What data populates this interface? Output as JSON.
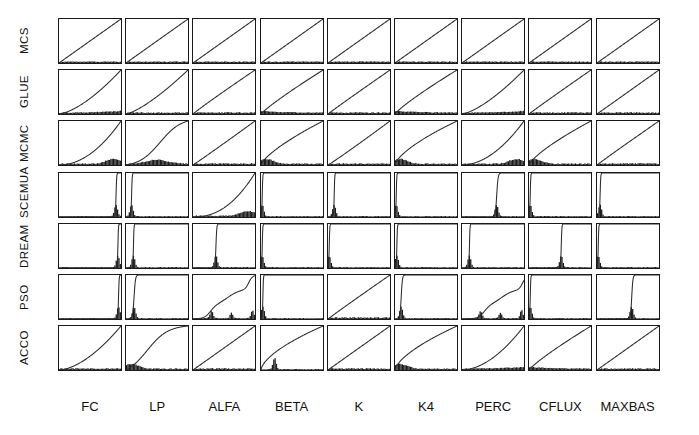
{
  "figure": {
    "type": "small-multiples-grid",
    "rows": 7,
    "cols": 9,
    "panel_type": "cdf-with-histogram"
  },
  "row_labels": [
    "MCS",
    "GLUE",
    "MCMC",
    "SCEMUA",
    "DREAM",
    "PSO",
    "ACCO"
  ],
  "col_labels": [
    "FC",
    "LP",
    "ALFA",
    "BETA",
    "K",
    "K4",
    "PERC",
    "CFLUX",
    "MAXBAS"
  ],
  "colors": {
    "curve": "#2b2b2b",
    "histogram": "#1b1b1b",
    "frame": "#1a1a1a",
    "background": "#ffffff"
  },
  "chart_data": {
    "type": "line",
    "title": "",
    "xlabel": "",
    "ylabel": "",
    "xlim": [
      0,
      1
    ],
    "ylim": [
      0,
      1
    ],
    "grid": false,
    "legend": "none",
    "x_categories": [
      "FC",
      "LP",
      "ALFA",
      "BETA",
      "K",
      "K4",
      "PERC",
      "CFLUX",
      "MAXBAS"
    ],
    "y_categories": [
      "MCS",
      "GLUE",
      "MCMC",
      "SCEMUA",
      "DREAM",
      "PSO",
      "ACCO"
    ],
    "panels": [
      {
        "row": "MCS",
        "col": "FC",
        "cdf_shape": "linear",
        "knee": 0.5,
        "sharp": 0.0,
        "hist": "uniform"
      },
      {
        "row": "MCS",
        "col": "LP",
        "cdf_shape": "linear",
        "knee": 0.5,
        "sharp": 0.0,
        "hist": "uniform"
      },
      {
        "row": "MCS",
        "col": "ALFA",
        "cdf_shape": "linear",
        "knee": 0.5,
        "sharp": 0.0,
        "hist": "uniform"
      },
      {
        "row": "MCS",
        "col": "BETA",
        "cdf_shape": "linear",
        "knee": 0.5,
        "sharp": 0.0,
        "hist": "uniform"
      },
      {
        "row": "MCS",
        "col": "K",
        "cdf_shape": "linear",
        "knee": 0.5,
        "sharp": 0.0,
        "hist": "uniform"
      },
      {
        "row": "MCS",
        "col": "K4",
        "cdf_shape": "linear",
        "knee": 0.5,
        "sharp": 0.0,
        "hist": "uniform"
      },
      {
        "row": "MCS",
        "col": "PERC",
        "cdf_shape": "linear",
        "knee": 0.5,
        "sharp": 0.0,
        "hist": "uniform"
      },
      {
        "row": "MCS",
        "col": "CFLUX",
        "cdf_shape": "linear",
        "knee": 0.5,
        "sharp": 0.0,
        "hist": "uniform"
      },
      {
        "row": "MCS",
        "col": "MAXBAS",
        "cdf_shape": "linear",
        "knee": 0.5,
        "sharp": 0.0,
        "hist": "uniform"
      },
      {
        "row": "GLUE",
        "col": "FC",
        "cdf_shape": "convex",
        "knee": 0.62,
        "sharp": 0.0,
        "hist": "low-right"
      },
      {
        "row": "GLUE",
        "col": "LP",
        "cdf_shape": "convex",
        "knee": 0.58,
        "sharp": 0.0,
        "hist": "low-flat"
      },
      {
        "row": "GLUE",
        "col": "ALFA",
        "cdf_shape": "near-linear",
        "knee": 0.54,
        "sharp": 0.0,
        "hist": "low-flat"
      },
      {
        "row": "GLUE",
        "col": "BETA",
        "cdf_shape": "concave",
        "knee": 0.42,
        "sharp": 0.0,
        "hist": "low-left"
      },
      {
        "row": "GLUE",
        "col": "K",
        "cdf_shape": "near-linear",
        "knee": 0.52,
        "sharp": 0.0,
        "hist": "low-flat"
      },
      {
        "row": "GLUE",
        "col": "K4",
        "cdf_shape": "concave",
        "knee": 0.4,
        "sharp": 0.0,
        "hist": "low-left"
      },
      {
        "row": "GLUE",
        "col": "PERC",
        "cdf_shape": "convex",
        "knee": 0.6,
        "sharp": 0.0,
        "hist": "low-right"
      },
      {
        "row": "GLUE",
        "col": "CFLUX",
        "cdf_shape": "near-linear",
        "knee": 0.52,
        "sharp": 0.0,
        "hist": "low-flat"
      },
      {
        "row": "GLUE",
        "col": "MAXBAS",
        "cdf_shape": "near-linear",
        "knee": 0.5,
        "sharp": 0.0,
        "hist": "low-flat"
      },
      {
        "row": "MCMC",
        "col": "FC",
        "cdf_shape": "convex",
        "knee": 0.74,
        "sharp": 0.0,
        "hist": "bump-right"
      },
      {
        "row": "MCMC",
        "col": "LP",
        "cdf_shape": "sigmoid",
        "knee": 0.55,
        "sharp": 0.0,
        "hist": "bump-center"
      },
      {
        "row": "MCMC",
        "col": "ALFA",
        "cdf_shape": "near-linear",
        "knee": 0.48,
        "sharp": 0.0,
        "hist": "low-flat"
      },
      {
        "row": "MCMC",
        "col": "BETA",
        "cdf_shape": "concave",
        "knee": 0.3,
        "sharp": 0.0,
        "hist": "bump-left"
      },
      {
        "row": "MCMC",
        "col": "K",
        "cdf_shape": "near-linear",
        "knee": 0.46,
        "sharp": 0.0,
        "hist": "low-flat"
      },
      {
        "row": "MCMC",
        "col": "K4",
        "cdf_shape": "concave",
        "knee": 0.26,
        "sharp": 0.0,
        "hist": "bump-left"
      },
      {
        "row": "MCMC",
        "col": "PERC",
        "cdf_shape": "convex",
        "knee": 0.72,
        "sharp": 0.0,
        "hist": "bump-right"
      },
      {
        "row": "MCMC",
        "col": "CFLUX",
        "cdf_shape": "concave",
        "knee": 0.32,
        "sharp": 0.0,
        "hist": "bump-left"
      },
      {
        "row": "MCMC",
        "col": "MAXBAS",
        "cdf_shape": "near-linear",
        "knee": 0.52,
        "sharp": 0.0,
        "hist": "low-flat"
      },
      {
        "row": "SCEMUA",
        "col": "FC",
        "cdf_shape": "step",
        "knee": 0.92,
        "sharp": 0.97,
        "hist": "spike-right"
      },
      {
        "row": "SCEMUA",
        "col": "LP",
        "cdf_shape": "step",
        "knee": 0.09,
        "sharp": 0.97,
        "hist": "spike-left"
      },
      {
        "row": "SCEMUA",
        "col": "ALFA",
        "cdf_shape": "convex",
        "knee": 0.8,
        "sharp": 0.0,
        "hist": "bump-right"
      },
      {
        "row": "SCEMUA",
        "col": "BETA",
        "cdf_shape": "step",
        "knee": 0.02,
        "sharp": 0.99,
        "hist": "spike-left"
      },
      {
        "row": "SCEMUA",
        "col": "K",
        "cdf_shape": "step",
        "knee": 0.1,
        "sharp": 0.98,
        "hist": "spike-left"
      },
      {
        "row": "SCEMUA",
        "col": "K4",
        "cdf_shape": "step",
        "knee": 0.02,
        "sharp": 0.99,
        "hist": "spike-left"
      },
      {
        "row": "SCEMUA",
        "col": "PERC",
        "cdf_shape": "step",
        "knee": 0.56,
        "sharp": 0.93,
        "hist": "spike-center"
      },
      {
        "row": "SCEMUA",
        "col": "CFLUX",
        "cdf_shape": "step",
        "knee": 0.02,
        "sharp": 0.99,
        "hist": "spike-left"
      },
      {
        "row": "SCEMUA",
        "col": "MAXBAS",
        "cdf_shape": "step",
        "knee": 0.05,
        "sharp": 0.97,
        "hist": "spike-left"
      },
      {
        "row": "DREAM",
        "col": "FC",
        "cdf_shape": "step",
        "knee": 0.95,
        "sharp": 0.98,
        "hist": "spike-right"
      },
      {
        "row": "DREAM",
        "col": "LP",
        "cdf_shape": "step",
        "knee": 0.12,
        "sharp": 0.99,
        "hist": "spike-left"
      },
      {
        "row": "DREAM",
        "col": "ALFA",
        "cdf_shape": "step",
        "knee": 0.37,
        "sharp": 0.96,
        "hist": "spike-center"
      },
      {
        "row": "DREAM",
        "col": "BETA",
        "cdf_shape": "step",
        "knee": 0.02,
        "sharp": 0.99,
        "hist": "spike-left"
      },
      {
        "row": "DREAM",
        "col": "K",
        "cdf_shape": "step",
        "knee": 0.02,
        "sharp": 0.99,
        "hist": "spike-left"
      },
      {
        "row": "DREAM",
        "col": "K4",
        "cdf_shape": "step",
        "knee": 0.03,
        "sharp": 0.98,
        "hist": "spike-left"
      },
      {
        "row": "DREAM",
        "col": "PERC",
        "cdf_shape": "step",
        "knee": 0.12,
        "sharp": 0.98,
        "hist": "spike-left"
      },
      {
        "row": "DREAM",
        "col": "CFLUX",
        "cdf_shape": "step",
        "knee": 0.52,
        "sharp": 0.97,
        "hist": "spike-center"
      },
      {
        "row": "DREAM",
        "col": "MAXBAS",
        "cdf_shape": "step",
        "knee": 0.02,
        "sharp": 0.99,
        "hist": "spike-left"
      },
      {
        "row": "PSO",
        "col": "FC",
        "cdf_shape": "step",
        "knee": 0.96,
        "sharp": 0.97,
        "hist": "spike-right"
      },
      {
        "row": "PSO",
        "col": "LP",
        "cdf_shape": "step",
        "knee": 0.13,
        "sharp": 0.93,
        "hist": "spike-left"
      },
      {
        "row": "PSO",
        "col": "ALFA",
        "cdf_shape": "staircase",
        "knee": 0.62,
        "sharp": 0.4,
        "hist": "multi-spike"
      },
      {
        "row": "PSO",
        "col": "BETA",
        "cdf_shape": "step",
        "knee": 0.03,
        "sharp": 0.98,
        "hist": "spike-left"
      },
      {
        "row": "PSO",
        "col": "K",
        "cdf_shape": "near-linear",
        "knee": 0.52,
        "sharp": 0.0,
        "hist": "low-flat"
      },
      {
        "row": "PSO",
        "col": "K4",
        "cdf_shape": "step",
        "knee": 0.1,
        "sharp": 0.94,
        "hist": "spike-left"
      },
      {
        "row": "PSO",
        "col": "PERC",
        "cdf_shape": "staircase",
        "knee": 0.7,
        "sharp": 0.45,
        "hist": "multi-spike"
      },
      {
        "row": "PSO",
        "col": "CFLUX",
        "cdf_shape": "step",
        "knee": 0.02,
        "sharp": 0.99,
        "hist": "spike-left"
      },
      {
        "row": "PSO",
        "col": "MAXBAS",
        "cdf_shape": "step",
        "knee": 0.56,
        "sharp": 0.94,
        "hist": "spike-center"
      },
      {
        "row": "ACCO",
        "col": "FC",
        "cdf_shape": "convex",
        "knee": 0.66,
        "sharp": 0.0,
        "hist": "low-flat"
      },
      {
        "row": "ACCO",
        "col": "LP",
        "cdf_shape": "sigmoid",
        "knee": 0.34,
        "sharp": 0.0,
        "hist": "bump-left"
      },
      {
        "row": "ACCO",
        "col": "ALFA",
        "cdf_shape": "near-linear",
        "knee": 0.5,
        "sharp": 0.0,
        "hist": "low-flat"
      },
      {
        "row": "ACCO",
        "col": "BETA",
        "cdf_shape": "concave",
        "knee": 0.22,
        "sharp": 0.0,
        "hist": "spike-left"
      },
      {
        "row": "ACCO",
        "col": "K",
        "cdf_shape": "near-linear",
        "knee": 0.5,
        "sharp": 0.0,
        "hist": "low-flat"
      },
      {
        "row": "ACCO",
        "col": "K4",
        "cdf_shape": "concave",
        "knee": 0.24,
        "sharp": 0.0,
        "hist": "bump-left"
      },
      {
        "row": "ACCO",
        "col": "PERC",
        "cdf_shape": "convex",
        "knee": 0.7,
        "sharp": 0.0,
        "hist": "low-right"
      },
      {
        "row": "ACCO",
        "col": "CFLUX",
        "cdf_shape": "concave",
        "knee": 0.4,
        "sharp": 0.0,
        "hist": "low-left"
      },
      {
        "row": "ACCO",
        "col": "MAXBAS",
        "cdf_shape": "linear",
        "knee": 0.52,
        "sharp": 0.0,
        "hist": "low-flat"
      }
    ]
  },
  "layout": {
    "grid_left": 58,
    "grid_top": 18,
    "panel_w": 64,
    "panel_h": 46,
    "gap_x": 3.2,
    "gap_y": 5.2,
    "col_label_y": 399,
    "row_label_x": 18
  }
}
